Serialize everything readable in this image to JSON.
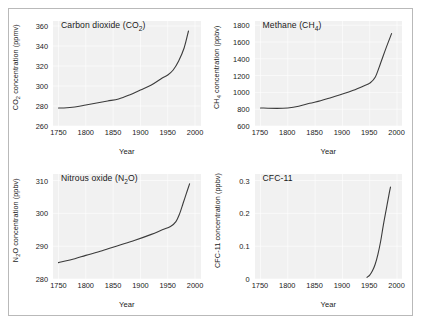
{
  "figure": {
    "background": "#ffffff",
    "border_color": "#b9b9b9",
    "plot_background": "#f1f1f1",
    "gridline_color": "#ffffff",
    "line_color": "#3b3b3b"
  },
  "chart_data": [
    {
      "type": "line",
      "id": "co2",
      "title": "Carbon dioxide (CO₂)",
      "title_main": "Carbon dioxide (CO",
      "title_sub": "2",
      "title_tail": ")",
      "xlabel": "Year",
      "ylabel": "CO₂ concentration (ppmv)",
      "ylabel_main": "CO",
      "ylabel_sub": "2",
      "ylabel_tail": " concentration (ppmv)",
      "xlim": [
        1740,
        2010
      ],
      "ylim": [
        260,
        365
      ],
      "xticks": [
        1750,
        1800,
        1850,
        1900,
        1950,
        2000
      ],
      "yticks": [
        260,
        280,
        300,
        320,
        340,
        360
      ],
      "grid": true,
      "x": [
        1750,
        1760,
        1780,
        1800,
        1820,
        1840,
        1860,
        1880,
        1900,
        1920,
        1940,
        1950,
        1960,
        1970,
        1980,
        1988
      ],
      "values": [
        278,
        278,
        279,
        281,
        283,
        285,
        287,
        291,
        296,
        301,
        308,
        311,
        316,
        325,
        338,
        355
      ]
    },
    {
      "type": "line",
      "id": "ch4",
      "title": "Methane (CH₄)",
      "title_main": "Methane (CH",
      "title_sub": "4",
      "title_tail": ")",
      "xlabel": "Year",
      "ylabel": "CH₄ concentration (ppbv)",
      "ylabel_main": "CH",
      "ylabel_sub": "4",
      "ylabel_tail": " concentration (ppbv)",
      "xlim": [
        1740,
        2010
      ],
      "ylim": [
        600,
        1850
      ],
      "xticks": [
        1750,
        1800,
        1850,
        1900,
        1950,
        2000
      ],
      "yticks": [
        600,
        800,
        1000,
        1200,
        1400,
        1600,
        1800
      ],
      "grid": true,
      "x": [
        1750,
        1780,
        1800,
        1820,
        1840,
        1860,
        1880,
        1900,
        1920,
        1940,
        1950,
        1960,
        1970,
        1980,
        1990
      ],
      "values": [
        815,
        810,
        815,
        835,
        870,
        900,
        940,
        980,
        1025,
        1080,
        1110,
        1180,
        1350,
        1530,
        1700
      ]
    },
    {
      "type": "line",
      "id": "n2o",
      "title": "Nitrous oxide (N₂O)",
      "title_main": "Nitrous oxide (N",
      "title_sub": "2",
      "title_tail": "O)",
      "xlabel": "Year",
      "ylabel": "N₂O concentration (ppbv)",
      "ylabel_main": "N",
      "ylabel_sub": "2",
      "ylabel_tail": "O concentration (ppbv)",
      "xlim": [
        1740,
        2010
      ],
      "ylim": [
        280,
        312
      ],
      "xticks": [
        1750,
        1800,
        1850,
        1900,
        1950,
        2000
      ],
      "yticks": [
        280,
        290,
        300,
        310
      ],
      "grid": true,
      "x": [
        1750,
        1780,
        1800,
        1830,
        1860,
        1890,
        1920,
        1940,
        1955,
        1965,
        1972,
        1978,
        1984,
        1990
      ],
      "values": [
        285,
        286.2,
        287.2,
        288.6,
        290.2,
        291.8,
        293.6,
        295,
        296,
        297.5,
        300,
        303,
        306,
        309
      ]
    },
    {
      "type": "line",
      "id": "cfc11",
      "title": "CFC-11",
      "title_main": "CFC-11",
      "title_sub": "",
      "title_tail": "",
      "xlabel": "Year",
      "ylabel": "CFC-11 concentration (ppbv)",
      "ylabel_main": "CFC-11 concentration (ppbv)",
      "ylabel_sub": "",
      "ylabel_tail": "",
      "xlim": [
        1740,
        2010
      ],
      "ylim": [
        0,
        0.32
      ],
      "xticks": [
        1750,
        1800,
        1850,
        1900,
        1950,
        2000
      ],
      "yticks": [
        0,
        0.1,
        0.2,
        0.3
      ],
      "ytick_labels": [
        "0",
        "0.1",
        "0.2",
        "0.3"
      ],
      "grid": true,
      "x": [
        1945,
        1950,
        1955,
        1960,
        1965,
        1970,
        1975,
        1980,
        1985,
        1988
      ],
      "values": [
        0.005,
        0.012,
        0.025,
        0.045,
        0.075,
        0.115,
        0.165,
        0.21,
        0.255,
        0.28
      ]
    }
  ]
}
